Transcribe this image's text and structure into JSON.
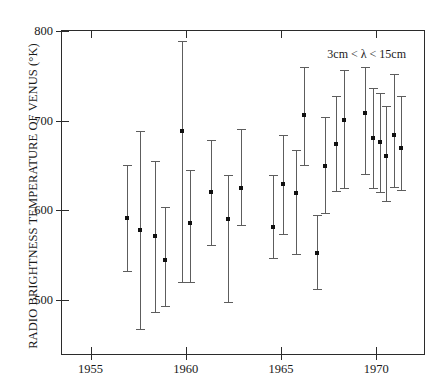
{
  "chart_data": {
    "type": "scatter",
    "title": "",
    "subtitle": "",
    "xlabel": "",
    "ylabel": "RADIO BRIGHTNESS TEMPERATURE OF VENUS (°K)",
    "annotation": "3cm < λ < 15cm",
    "grid": false,
    "legend": "none",
    "xlim": [
      1953.5,
      1972.5
    ],
    "ylim": [
      440,
      800
    ],
    "xticks": [
      1955,
      1960,
      1965,
      1970
    ],
    "xtick_labels": [
      "1955",
      "1960",
      "1965",
      "1970"
    ],
    "yticks": [
      500,
      600,
      700,
      800
    ],
    "ytick_labels": [
      "500",
      "600",
      "700",
      "800"
    ],
    "error_style": "vertical bars with caps",
    "marker_style": "filled square",
    "points": [
      {
        "x": 1956.9,
        "y": 592,
        "ylow": 533,
        "yhigh": 651
      },
      {
        "x": 1957.6,
        "y": 578,
        "ylow": 468,
        "yhigh": 688
      },
      {
        "x": 1958.4,
        "y": 571,
        "ylow": 487,
        "yhigh": 655
      },
      {
        "x": 1958.9,
        "y": 545,
        "ylow": 493,
        "yhigh": 604
      },
      {
        "x": 1959.8,
        "y": 688,
        "ylow": 520,
        "yhigh": 789
      },
      {
        "x": 1960.2,
        "y": 586,
        "ylow": 520,
        "yhigh": 645
      },
      {
        "x": 1961.3,
        "y": 621,
        "ylow": 562,
        "yhigh": 679
      },
      {
        "x": 1962.2,
        "y": 590,
        "ylow": 498,
        "yhigh": 639
      },
      {
        "x": 1962.9,
        "y": 625,
        "ylow": 584,
        "yhigh": 691
      },
      {
        "x": 1964.6,
        "y": 581,
        "ylow": 547,
        "yhigh": 640
      },
      {
        "x": 1965.1,
        "y": 630,
        "ylow": 574,
        "yhigh": 684
      },
      {
        "x": 1965.8,
        "y": 620,
        "ylow": 552,
        "yhigh": 667
      },
      {
        "x": 1966.2,
        "y": 706,
        "ylow": 651,
        "yhigh": 760
      },
      {
        "x": 1966.9,
        "y": 553,
        "ylow": 512,
        "yhigh": 595
      },
      {
        "x": 1967.3,
        "y": 650,
        "ylow": 597,
        "yhigh": 704
      },
      {
        "x": 1967.9,
        "y": 674,
        "ylow": 622,
        "yhigh": 727
      },
      {
        "x": 1968.3,
        "y": 701,
        "ylow": 625,
        "yhigh": 756
      },
      {
        "x": 1969.4,
        "y": 709,
        "ylow": 641,
        "yhigh": 760
      },
      {
        "x": 1969.8,
        "y": 681,
        "ylow": 625,
        "yhigh": 736
      },
      {
        "x": 1970.2,
        "y": 676,
        "ylow": 621,
        "yhigh": 731
      },
      {
        "x": 1970.5,
        "y": 661,
        "ylow": 611,
        "yhigh": 716
      },
      {
        "x": 1970.9,
        "y": 684,
        "ylow": 626,
        "yhigh": 752
      },
      {
        "x": 1971.3,
        "y": 670,
        "ylow": 623,
        "yhigh": 728
      }
    ]
  },
  "axes": {
    "frame_color": "#2b2b2b",
    "marker_color": "#101010",
    "error_color": "#5d5d5d"
  }
}
